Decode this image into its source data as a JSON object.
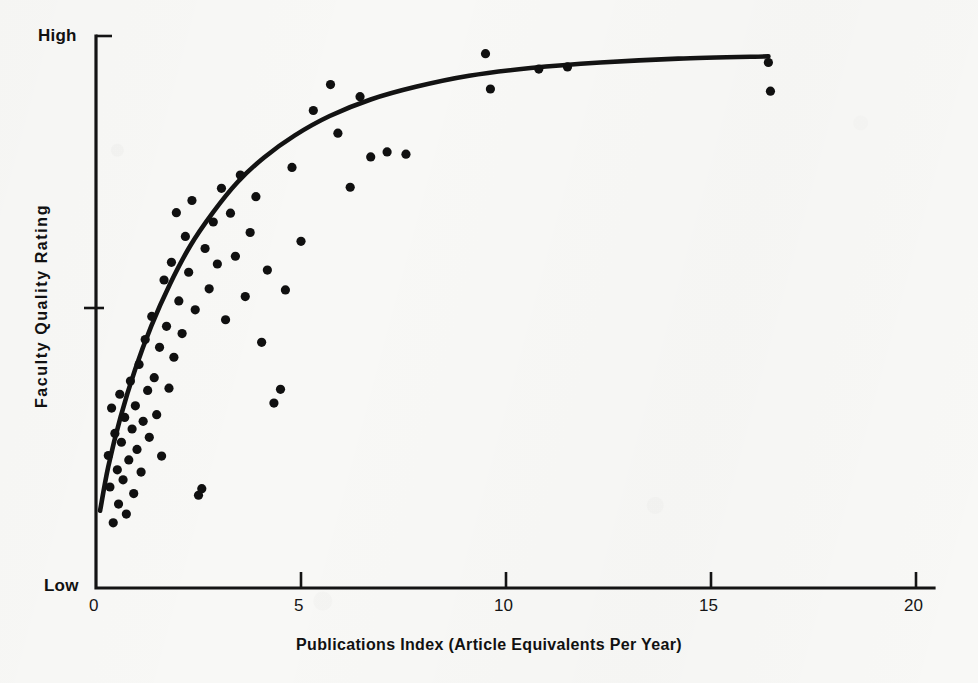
{
  "chart_data": {
    "type": "scatter",
    "title": "",
    "xlabel": "Publications Index (Article Equivalents Per Year)",
    "ylabel": "Faculty Quality Rating",
    "xlim": [
      0,
      20
    ],
    "ylim": [
      0,
      100
    ],
    "grid": false,
    "legend": null,
    "x_ticks": [
      {
        "value": 0,
        "label": "0"
      },
      {
        "value": 5,
        "label": "5"
      },
      {
        "value": 10,
        "label": "10"
      },
      {
        "value": 15,
        "label": "15"
      },
      {
        "value": 20,
        "label": "20"
      }
    ],
    "y_ticks": [
      {
        "value": 100,
        "label": "High"
      },
      {
        "value": 50,
        "label": ""
      },
      {
        "value": 0,
        "label": "Low"
      }
    ],
    "y_axis_end_labels": {
      "top": "High",
      "bottom": "Low"
    },
    "series": [
      {
        "name": "Departments",
        "marker": "filled-circle",
        "marker_color": "#101010",
        "points": [
          [
            0.3,
            24.0
          ],
          [
            0.34,
            18.3
          ],
          [
            0.38,
            32.6
          ],
          [
            0.42,
            11.8
          ],
          [
            0.46,
            28.0
          ],
          [
            0.52,
            21.4
          ],
          [
            0.55,
            15.2
          ],
          [
            0.58,
            35.1
          ],
          [
            0.62,
            26.4
          ],
          [
            0.66,
            19.6
          ],
          [
            0.7,
            30.9
          ],
          [
            0.74,
            13.4
          ],
          [
            0.8,
            23.2
          ],
          [
            0.84,
            37.5
          ],
          [
            0.88,
            28.8
          ],
          [
            0.92,
            17.1
          ],
          [
            0.96,
            33.0
          ],
          [
            1.0,
            25.1
          ],
          [
            1.05,
            40.5
          ],
          [
            1.1,
            21.0
          ],
          [
            1.15,
            30.2
          ],
          [
            1.2,
            45.0
          ],
          [
            1.26,
            35.8
          ],
          [
            1.3,
            27.3
          ],
          [
            1.36,
            49.2
          ],
          [
            1.42,
            38.1
          ],
          [
            1.48,
            31.4
          ],
          [
            1.55,
            43.6
          ],
          [
            1.6,
            23.9
          ],
          [
            1.66,
            55.8
          ],
          [
            1.72,
            47.4
          ],
          [
            1.78,
            36.2
          ],
          [
            1.84,
            59.0
          ],
          [
            1.9,
            41.8
          ],
          [
            1.96,
            68.0
          ],
          [
            2.02,
            52.0
          ],
          [
            2.1,
            46.1
          ],
          [
            2.18,
            63.7
          ],
          [
            2.26,
            57.2
          ],
          [
            2.34,
            70.2
          ],
          [
            2.42,
            50.4
          ],
          [
            2.5,
            16.8
          ],
          [
            2.58,
            18.0
          ],
          [
            2.66,
            61.5
          ],
          [
            2.76,
            54.2
          ],
          [
            2.86,
            66.3
          ],
          [
            2.96,
            58.7
          ],
          [
            3.06,
            72.4
          ],
          [
            3.16,
            48.6
          ],
          [
            3.28,
            67.9
          ],
          [
            3.4,
            60.1
          ],
          [
            3.52,
            74.8
          ],
          [
            3.64,
            52.8
          ],
          [
            3.76,
            64.4
          ],
          [
            3.9,
            70.9
          ],
          [
            4.04,
            44.5
          ],
          [
            4.18,
            57.6
          ],
          [
            4.34,
            33.5
          ],
          [
            4.5,
            36.0
          ],
          [
            4.62,
            54.0
          ],
          [
            4.78,
            76.2
          ],
          [
            5.0,
            62.8
          ],
          [
            5.3,
            86.5
          ],
          [
            5.72,
            91.2
          ],
          [
            5.9,
            82.4
          ],
          [
            6.2,
            72.6
          ],
          [
            6.44,
            89.0
          ],
          [
            6.7,
            78.1
          ],
          [
            7.1,
            79.0
          ],
          [
            7.56,
            78.6
          ],
          [
            9.5,
            96.8
          ],
          [
            9.62,
            90.4
          ],
          [
            10.8,
            94.0
          ],
          [
            11.5,
            94.4
          ],
          [
            16.4,
            95.2
          ],
          [
            16.45,
            90.0
          ]
        ]
      }
    ],
    "fit_curve": {
      "name": "fitted-trend-curve",
      "style": "solid",
      "color": "#131313",
      "description": "Concave increasing curve (diminishing returns) rising steeply from low publications index and flattening near the top of the quality scale.",
      "points": [
        [
          0.1,
          14.0
        ],
        [
          0.3,
          22.0
        ],
        [
          0.6,
          31.0
        ],
        [
          0.95,
          39.5
        ],
        [
          1.35,
          47.5
        ],
        [
          1.8,
          55.0
        ],
        [
          2.3,
          62.0
        ],
        [
          2.85,
          68.0
        ],
        [
          3.45,
          73.5
        ],
        [
          4.1,
          78.0
        ],
        [
          4.85,
          82.0
        ],
        [
          5.7,
          85.5
        ],
        [
          6.7,
          88.5
        ],
        [
          7.8,
          90.8
        ],
        [
          9.1,
          92.8
        ],
        [
          10.6,
          94.2
        ],
        [
          12.3,
          95.2
        ],
        [
          14.2,
          95.9
        ],
        [
          16.4,
          96.3
        ]
      ]
    }
  },
  "axes": {
    "x_title": "Publications Index (Article Equivalents Per Year)",
    "y_title": "Faculty  Quality  Rating",
    "y_top_label": "High",
    "y_bottom_label": "Low",
    "x_tick_labels": [
      "0",
      "5",
      "10",
      "15",
      "20"
    ]
  },
  "colors": {
    "ink": "#131313",
    "paper": "#f8f8f6",
    "marker": "#101010"
  }
}
